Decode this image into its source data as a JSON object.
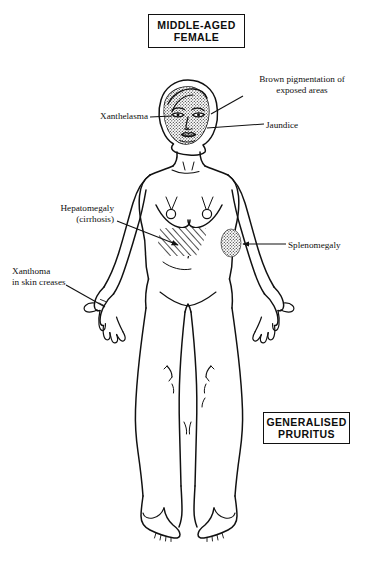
{
  "diagram": {
    "title_box": {
      "text": "MIDDLE-AGED\nFEMALE"
    },
    "bottom_box": {
      "text": "GENERALISED\nPRURITUS"
    },
    "labels": [
      {
        "id": "brown-pigmentation",
        "text": "Brown pigmentation of\nexposed areas",
        "side": "right",
        "points_to": "face"
      },
      {
        "id": "jaundice",
        "text": "Jaundice",
        "side": "right",
        "points_to": "face-lower-cheek"
      },
      {
        "id": "xanthelasma",
        "text": "Xanthelasma",
        "side": "left",
        "points_to": "eyelid"
      },
      {
        "id": "hepatomegaly",
        "text": "Hepatomegaly\n(cirrhosis)",
        "side": "left",
        "points_to": "right-upper-abdomen-hatched-area"
      },
      {
        "id": "splenomegaly",
        "text": "Splenomegaly",
        "side": "right",
        "points_to": "left-upper-abdomen-stippled-area"
      },
      {
        "id": "xanthoma",
        "text": "Xanthoma\nin skin creases",
        "side": "left",
        "points_to": "left-hand-skin-creases"
      }
    ],
    "shaded_regions": [
      {
        "id": "face-pigmentation",
        "style": "stipple",
        "meaning": "brown pigmentation of exposed areas"
      },
      {
        "id": "liver-enlargement",
        "style": "diagonal-hatch",
        "meaning": "enlarged liver (hepatomegaly / cirrhosis)"
      },
      {
        "id": "spleen-enlargement",
        "style": "stipple",
        "meaning": "enlarged spleen (splenomegaly)"
      }
    ],
    "colors": {
      "ink": "#111111",
      "background": "#ffffff",
      "shade": "#6e6e6e"
    }
  }
}
